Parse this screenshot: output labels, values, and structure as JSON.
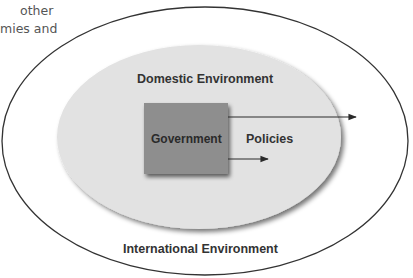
{
  "text_fragment": {
    "lines": [
      "other",
      "mies and"
    ]
  },
  "diagram": {
    "outer_environment": {
      "label": "International Environment",
      "stroke_color": "#333333",
      "fill_color": "#ffffff"
    },
    "inner_environment": {
      "label": "Domestic Environment",
      "fill_color": "#e2e2e2",
      "shadow_color": "#888888"
    },
    "actor": {
      "label": "Government",
      "fill_color": "#8e8e8e"
    },
    "output": {
      "label": "Policies",
      "arrows": [
        {
          "name": "policies-to-international",
          "target": "International Environment"
        },
        {
          "name": "policies-to-domestic",
          "target": "Domestic Environment"
        }
      ],
      "arrow_color": "#2a2a2a"
    }
  }
}
